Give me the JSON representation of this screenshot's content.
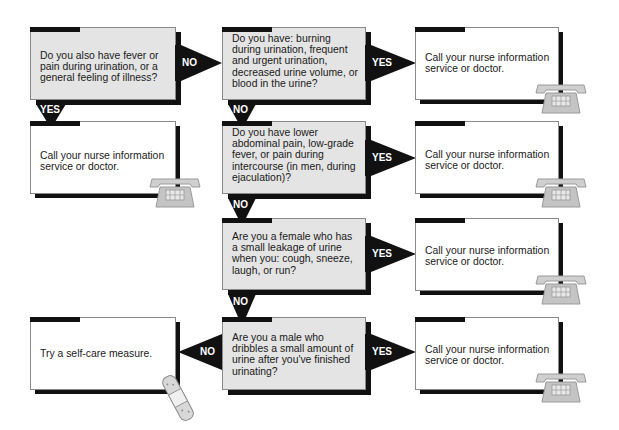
{
  "flowchart": {
    "questions": [
      {
        "id": "q1",
        "text": "Do you also have fever or pain during urination, or a general feeling of illness?"
      },
      {
        "id": "q2",
        "text": "Do you have: burning during urination, frequent and urgent urination, decreased urine volume, or blood in the urine?"
      },
      {
        "id": "q3",
        "text": "Do you have lower abdominal pain, low-grade fever, or pain during intercourse (in men, during ejaculation)?"
      },
      {
        "id": "q4",
        "text": "Are you a female who has a small leakage of urine when you: cough, sneeze, laugh, or run?"
      },
      {
        "id": "q5",
        "text": "Are you a male who dribbles a small amount of urine after you've finished urinating?"
      }
    ],
    "outcomes": [
      {
        "id": "o1",
        "text": "Call your nurse information service or doctor.",
        "icon": "telephone-icon"
      },
      {
        "id": "o2",
        "text": "Call your nurse information service or doctor.",
        "icon": "telephone-icon"
      },
      {
        "id": "o3",
        "text": "Call your nurse information service or doctor.",
        "icon": "telephone-icon"
      },
      {
        "id": "o4",
        "text": "Call your nurse information service or doctor.",
        "icon": "telephone-icon"
      },
      {
        "id": "o5",
        "text": "Call your nurse information service or doctor.",
        "icon": "telephone-icon"
      },
      {
        "id": "o6",
        "text": "Try a self-care measure.",
        "icon": "bandage-icon"
      }
    ],
    "labels": {
      "yes": "YES",
      "no": "NO"
    },
    "connections": [
      {
        "from": "q1",
        "to": "q2",
        "label": "NO"
      },
      {
        "from": "q1",
        "to": "o1",
        "label": "YES"
      },
      {
        "from": "q2",
        "to": "o2",
        "label": "YES"
      },
      {
        "from": "q2",
        "to": "q3",
        "label": "NO"
      },
      {
        "from": "q3",
        "to": "o3",
        "label": "YES"
      },
      {
        "from": "q3",
        "to": "q4",
        "label": "NO"
      },
      {
        "from": "q4",
        "to": "o4",
        "label": "YES"
      },
      {
        "from": "q4",
        "to": "q5",
        "label": "NO"
      },
      {
        "from": "q5",
        "to": "o5",
        "label": "YES"
      },
      {
        "from": "q5",
        "to": "o6",
        "label": "NO"
      }
    ],
    "colors": {
      "question_fill": "#e4e4e4",
      "outcome_fill": "#ffffff",
      "shadow": "#111111",
      "icon_gray": "#c8c8c8"
    }
  }
}
